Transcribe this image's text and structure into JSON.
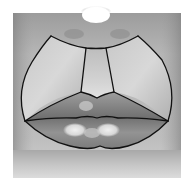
{
  "figure": {
    "colors": {
      "background": "#ffffff",
      "skin_light": "#d8d8d8",
      "skin_mid": "#a8a8a8",
      "skin_dark": "#6e6e6e",
      "nose_highlight": "#ffffff",
      "lip_upper": "#8a8a8a",
      "lip_lower": "#9a9a9a",
      "lip_highlight": "#e6e6e6",
      "outline": "#111111"
    },
    "regions": [
      {
        "name": "left-upper-lip-subunit"
      },
      {
        "name": "philtrum"
      },
      {
        "name": "right-upper-lip-subunit"
      },
      {
        "name": "upper-vermilion"
      },
      {
        "name": "lower-vermilion"
      }
    ]
  }
}
